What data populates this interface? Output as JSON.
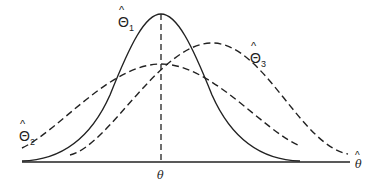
{
  "diagram": {
    "colors": {
      "ink": "#222222",
      "background": "#ffffff"
    },
    "axis": {
      "x_label": "θ̂",
      "x_label_base": "θ",
      "x_label_hat": "^",
      "true_value_label": "θ"
    },
    "curves": [
      {
        "id": "theta1",
        "label_base": "Θ",
        "label_hat": "^",
        "label_sub": "1",
        "style": "solid",
        "description": "unbiased, low variance"
      },
      {
        "id": "theta2",
        "label_base": "Θ",
        "label_hat": "^",
        "label_sub": "2",
        "style": "dashed",
        "description": "unbiased, high variance"
      },
      {
        "id": "theta3",
        "label_base": "Θ",
        "label_hat": "^",
        "label_sub": "3",
        "style": "dashed",
        "description": "biased, moderate variance"
      }
    ]
  }
}
